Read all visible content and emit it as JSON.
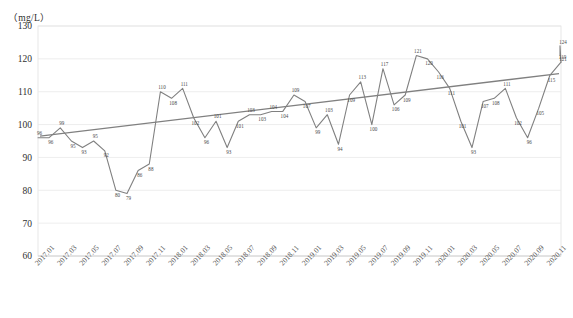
{
  "chart_data": {
    "type": "line",
    "title": "",
    "subtitle": "",
    "unit_label": "（mg/L）",
    "xlabel": "",
    "ylabel": "",
    "ylim": [
      60,
      130
    ],
    "ytick_step": 10,
    "yticks": [
      60,
      70,
      80,
      90,
      100,
      110,
      120,
      130
    ],
    "grid": true,
    "grid_axis": "y",
    "legend": "none",
    "legend_position": "none",
    "xtick_labels": [
      "2017.01",
      "2017.03",
      "2017.05",
      "2017.07",
      "2017.09",
      "2017.11",
      "2018.01",
      "2018.03",
      "2018.05",
      "2018.07",
      "2018.09",
      "2018.11",
      "2019.01",
      "2019.03",
      "2019.05",
      "2019.07",
      "2019.09",
      "2019.11",
      "2020.01",
      "2020.03",
      "2020.05",
      "2020.07",
      "2020.09",
      "2020.11"
    ],
    "x": [
      "2017.01",
      "2017.02",
      "2017.03",
      "2017.04",
      "2017.05",
      "2017.06",
      "2017.07",
      "2017.08",
      "2017.09",
      "2017.10",
      "2017.11",
      "2017.12",
      "2018.01",
      "2018.02",
      "2018.03",
      "2018.04",
      "2018.05",
      "2018.06",
      "2018.07",
      "2018.08",
      "2018.09",
      "2018.10",
      "2018.11",
      "2018.12",
      "2019.01",
      "2019.02",
      "2019.03",
      "2019.04",
      "2019.05",
      "2019.06",
      "2019.07",
      "2019.08",
      "2019.09",
      "2019.10",
      "2019.11",
      "2019.12",
      "2020.01",
      "2020.02",
      "2020.03",
      "2020.04",
      "2020.05",
      "2020.06",
      "2020.07",
      "2020.08",
      "2020.09",
      "2020.10",
      "2020.11",
      "2020.12"
    ],
    "series": [
      {
        "name": "monthly-value",
        "type": "line",
        "color": "#808080",
        "values": [
          96,
          96,
          99,
          95,
          93,
          95,
          92,
          80,
          79,
          86,
          88,
          110,
          108,
          111,
          102,
          96,
          101,
          93,
          101,
          103,
          103,
          104,
          104,
          109,
          107,
          99,
          103,
          94,
          109,
          113,
          100,
          117,
          106,
          109,
          121,
          120,
          116,
          111,
          101,
          93,
          107,
          108,
          111,
          102,
          96,
          105,
          115,
          119
        ],
        "point_labels": [
          "96",
          "96",
          "99",
          "95",
          "93",
          "95",
          "92",
          "80",
          "79",
          "86",
          "88",
          "110",
          "108",
          "111",
          "102",
          "96",
          "101",
          "93",
          "101",
          "103",
          "103",
          "104",
          "104",
          "109",
          "107",
          "99",
          "103",
          "94",
          "109",
          "113",
          "100",
          "117",
          "106",
          "109",
          "121",
          "120",
          "116",
          "111",
          "101",
          "93",
          "107",
          "108",
          "111",
          "102",
          "96",
          "105",
          "115",
          "119"
        ]
      },
      {
        "name": "trend-line",
        "type": "line",
        "color": "#808080",
        "style": "straight-trend",
        "start_value": 96.5,
        "end_value": 115.5
      }
    ],
    "tail_labels": [
      "124",
      "121"
    ],
    "tail_values": [
      124,
      121
    ]
  }
}
